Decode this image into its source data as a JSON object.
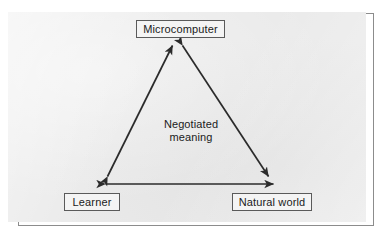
{
  "figure": {
    "kind": "triangle-relationship-diagram",
    "panel_background": "#eaeaea",
    "line_color": "#2b2b2b",
    "box_fill": "#f4f4f4",
    "box_border": "#5a5a5a",
    "text_color": "#1b1b1b"
  },
  "nodes": [
    {
      "id": "microcomputer",
      "label": "Microcomputer"
    },
    {
      "id": "learner",
      "label": "Learner"
    },
    {
      "id": "natural-world",
      "label": "Natural world"
    }
  ],
  "center_label": {
    "line1": "Negotiated",
    "line2": "meaning"
  },
  "connectors": [
    {
      "id": "learner-microcomputer",
      "from": "learner",
      "to": "microcomputer",
      "style": "double-headed-arrow"
    },
    {
      "id": "microcomputer-natural-world",
      "from": "microcomputer",
      "to": "natural-world",
      "style": "double-headed-arrow"
    },
    {
      "id": "learner-natural-world",
      "from": "learner",
      "to": "natural-world",
      "style": "double-headed-arrow"
    }
  ]
}
